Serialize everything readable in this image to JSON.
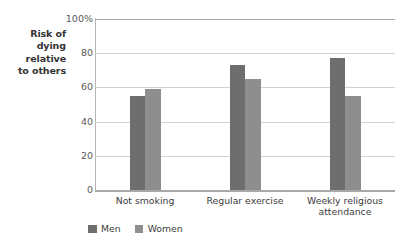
{
  "chart_data": {
    "type": "bar",
    "title": "",
    "subtitle": "",
    "xlabel": "",
    "ylabel": "Risk of\ndying\nrelative\nto others",
    "categories": [
      "Not smoking",
      "Regular exercise",
      "Weekly religious\nattendance"
    ],
    "series": [
      {
        "name": "Men",
        "values": [
          55,
          73,
          77
        ],
        "color": "#6e6e6e"
      },
      {
        "name": "Women",
        "values": [
          59,
          65,
          55
        ],
        "color": "#8e8e8e"
      }
    ],
    "ylim": [
      0,
      100
    ],
    "ytick_values": [
      100,
      80,
      60,
      40,
      20,
      0
    ],
    "ytick_labels": [
      "100%",
      "80",
      "60",
      "40",
      "20",
      "0"
    ],
    "grid": "horizontal",
    "legend_position": "bottom-left",
    "bar_grouping": "adjacent-no-gap"
  },
  "legend": {
    "entries": [
      {
        "label": "Men",
        "color": "#6e6e6e"
      },
      {
        "label": "Women",
        "color": "#8e8e8e"
      }
    ]
  },
  "colors": {
    "men": "#6e6e6e",
    "women": "#8e8e8e",
    "gridline": "#d2d2d2",
    "axis": "#a8a8a8",
    "text": "#3c3c3c",
    "tick_text": "#5a5a5a",
    "background": "#ffffff"
  }
}
